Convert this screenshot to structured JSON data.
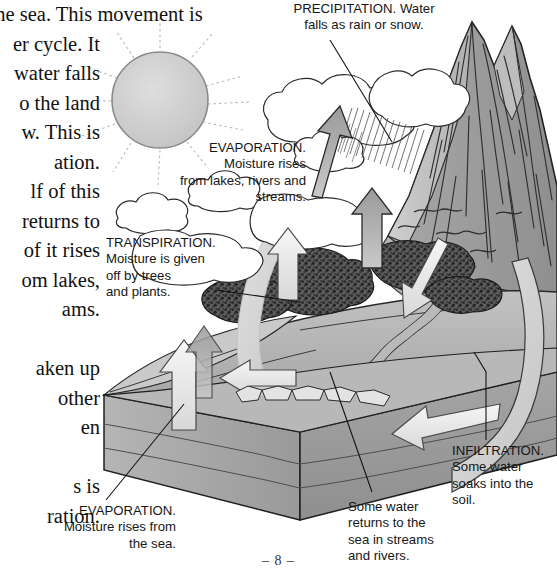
{
  "page": {
    "number": "– 8 –",
    "width": 557,
    "height": 579,
    "background": "#ffffff"
  },
  "body_text": {
    "note": "Serif body column clipped by the left page edge; lines shown partially.",
    "lines": [
      "nd the sea. This movement is",
      "er cycle. It",
      "water falls",
      "o the land",
      "w. This is",
      "ation.",
      "lf of this",
      "returns to",
      "of it rises",
      "om lakes,",
      "ams.",
      "aken up",
      "other",
      "en",
      "s is",
      "ration."
    ]
  },
  "labels": {
    "precipitation": {
      "name": "PRECIPITATION.",
      "text": "PRECIPITATION. Water\nfalls as rain or snow.",
      "align": "center"
    },
    "evaporation_lakes": {
      "name": "EVAPORATION.",
      "text": "EVAPORATION.\nMoisture rises\nfrom lakes, rivers and\nstreams.",
      "align": "right"
    },
    "transpiration": {
      "name": "TRANSPIRATION.",
      "text": "TRANSPIRATION.\nMoisture is given\noff by trees\nand plants.",
      "align": "left"
    },
    "infiltration": {
      "name": "INFILTRATION.",
      "text": "INFILTRATION.\nSome water\nsoaks into the\nsoil.",
      "align": "left"
    },
    "sea_return": {
      "name": "runoff",
      "text": "Some water\nreturns to the\nsea in streams\nand rivers.",
      "align": "left"
    },
    "evaporation_sea": {
      "name": "EVAPORATION.",
      "text": "EVAPORATION.\nMoisture rises from\nthe sea.",
      "align": "right"
    }
  },
  "illustration": {
    "title": "The water cycle",
    "elements": [
      "sun",
      "sun-rays",
      "clouds",
      "rain-shafts",
      "mountain",
      "forest",
      "river",
      "sea-block",
      "evaporation-arrows",
      "precipitation-arrow",
      "infiltration-band",
      "runoff-arrows"
    ],
    "colors": {
      "paper": "#ffffff",
      "ink": "#161616",
      "sun_fill": "#cfcfcf",
      "mountain_light": "#c6c6c6",
      "mountain_mid": "#a9a9a9",
      "mountain_dark": "#8e8e8e",
      "land_top": "#b3b3b3",
      "soil_front": "#9a9a9a",
      "soil_side": "#8a8a8a",
      "water_band": "#d2d2d2",
      "forest_dark": "#4a4a4a",
      "arrow_gray": "#9e9e9e",
      "arrow_white": "#ececec",
      "outline": "#2b2b2b",
      "leader_line": "#1a1a1a"
    }
  }
}
